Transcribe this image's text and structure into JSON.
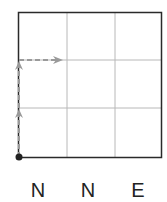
{
  "diagram": {
    "grid": {
      "rows": 3,
      "cols": 3,
      "outer_color": "#222222",
      "inner_color": "#b0b0b0"
    },
    "path": {
      "start": "bottom-left corner",
      "moves": [
        "N",
        "N",
        "E"
      ],
      "color": "#999999",
      "style": "dashed with arrowheads"
    },
    "labels": [
      "N",
      "N",
      "E"
    ]
  }
}
